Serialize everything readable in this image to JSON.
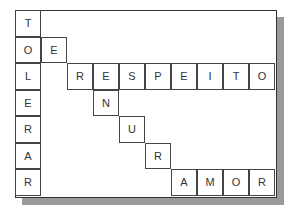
{
  "puzzle": {
    "cols": 10,
    "rows": 7,
    "vertical_word": "TOLERAR",
    "words": [
      "TOLERAR",
      "RESPEITO",
      "AMOR"
    ],
    "cells": [
      {
        "r": 0,
        "c": 0,
        "letter": "T"
      },
      {
        "r": 1,
        "c": 0,
        "letter": "O"
      },
      {
        "r": 1,
        "c": 1,
        "letter": "E"
      },
      {
        "r": 2,
        "c": 0,
        "letter": "L"
      },
      {
        "r": 2,
        "c": 2,
        "letter": "R"
      },
      {
        "r": 2,
        "c": 3,
        "letter": "E"
      },
      {
        "r": 2,
        "c": 4,
        "letter": "S"
      },
      {
        "r": 2,
        "c": 5,
        "letter": "P"
      },
      {
        "r": 2,
        "c": 6,
        "letter": "E"
      },
      {
        "r": 2,
        "c": 7,
        "letter": "I"
      },
      {
        "r": 2,
        "c": 8,
        "letter": "T"
      },
      {
        "r": 2,
        "c": 9,
        "letter": "O"
      },
      {
        "r": 3,
        "c": 0,
        "letter": "E"
      },
      {
        "r": 3,
        "c": 3,
        "letter": "N"
      },
      {
        "r": 4,
        "c": 0,
        "letter": "R"
      },
      {
        "r": 4,
        "c": 4,
        "letter": "U"
      },
      {
        "r": 5,
        "c": 0,
        "letter": "A"
      },
      {
        "r": 5,
        "c": 5,
        "letter": "R"
      },
      {
        "r": 6,
        "c": 0,
        "letter": "R"
      },
      {
        "r": 6,
        "c": 6,
        "letter": "A"
      },
      {
        "r": 6,
        "c": 7,
        "letter": "M"
      },
      {
        "r": 6,
        "c": 8,
        "letter": "O"
      },
      {
        "r": 6,
        "c": 9,
        "letter": "R"
      }
    ]
  }
}
